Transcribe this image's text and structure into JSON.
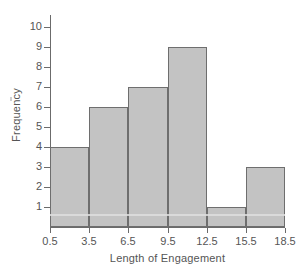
{
  "chart_data": {
    "type": "bar",
    "title": "",
    "xlabel": "Length of Engagement",
    "ylabel": "Frequency",
    "categories": [
      "0.5-3.5",
      "3.5-6.5",
      "6.5-9.5",
      "9.5-12.5",
      "12.5-15.5",
      "15.5-18.5"
    ],
    "bin_edges": [
      0.5,
      3.5,
      6.5,
      9.5,
      12.5,
      15.5,
      18.5
    ],
    "values": [
      4,
      6,
      7,
      9,
      1,
      3
    ],
    "xtick_labels": [
      "0.5",
      "3.5",
      "6.5",
      "9.5",
      "12.5",
      "15.5",
      "18.5"
    ],
    "ytick_labels": [
      "1",
      "2",
      "3",
      "4",
      "5",
      "6",
      "7",
      "8",
      "9",
      "10"
    ],
    "ytick_values": [
      1,
      2,
      3,
      4,
      5,
      6,
      7,
      8,
      9,
      10
    ],
    "ylim": [
      0,
      10.6
    ],
    "xlim": [
      0.5,
      18.5
    ],
    "grid": false,
    "legend": false,
    "bar_fill_color": "#c3c3c3",
    "bar_edge_color": "#6e6e6e",
    "axis_color": "#6b6b6b",
    "text_color": "#555555"
  }
}
